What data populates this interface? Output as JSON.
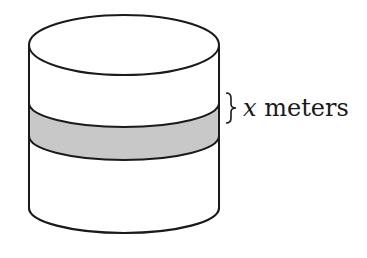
{
  "figure": {
    "type": "cylinder-diagram",
    "band_label": {
      "variable": "x",
      "unit": " meters"
    },
    "colors": {
      "stroke": "#1a1a1a",
      "band_fill": "#c8c8c8",
      "background": "#ffffff"
    }
  }
}
